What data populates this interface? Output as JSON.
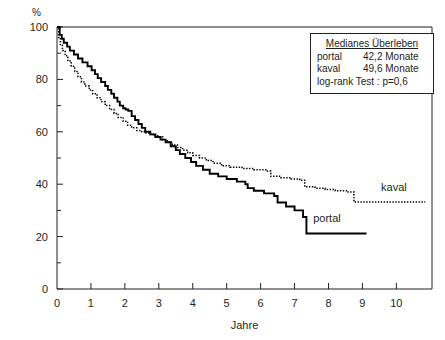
{
  "chart_data": {
    "type": "line",
    "title": "",
    "xlabel": "Jahre",
    "ylabel": "%",
    "xlim": [
      0,
      11.05
    ],
    "ylim": [
      0,
      100
    ],
    "grid": false,
    "legend_position": "top-right",
    "x_ticks": [
      "0",
      "1",
      "2",
      "3",
      "4",
      "5",
      "6",
      "7",
      "8",
      "9",
      "10"
    ],
    "x_tick_values": [
      0,
      1,
      2,
      3,
      4,
      5,
      6,
      7,
      8,
      9,
      10
    ],
    "y_ticks": [
      "0",
      "20",
      "40",
      "60",
      "80",
      "100"
    ],
    "y_tick_values": [
      0,
      20,
      40,
      60,
      80,
      100
    ],
    "y_minor_values": [
      10,
      30,
      50,
      70,
      90
    ],
    "series": [
      {
        "name": "portal",
        "style": "solid",
        "label": "portal",
        "label_x": 7.55,
        "label_y": 25.5,
        "steps": [
          [
            0.0,
            100
          ],
          [
            0.08,
            97
          ],
          [
            0.14,
            95.5
          ],
          [
            0.2,
            94
          ],
          [
            0.3,
            92.5
          ],
          [
            0.38,
            91
          ],
          [
            0.5,
            89.5
          ],
          [
            0.62,
            88
          ],
          [
            0.75,
            86.5
          ],
          [
            0.9,
            85
          ],
          [
            1.02,
            83.5
          ],
          [
            1.12,
            82
          ],
          [
            1.2,
            80.5
          ],
          [
            1.3,
            79
          ],
          [
            1.42,
            77.5
          ],
          [
            1.5,
            76
          ],
          [
            1.6,
            74.5
          ],
          [
            1.68,
            73
          ],
          [
            1.78,
            71.5
          ],
          [
            1.85,
            70
          ],
          [
            1.95,
            69
          ],
          [
            2.02,
            68.5
          ],
          [
            2.1,
            68
          ],
          [
            2.2,
            66
          ],
          [
            2.3,
            64.5
          ],
          [
            2.4,
            63
          ],
          [
            2.5,
            61.5
          ],
          [
            2.6,
            60
          ],
          [
            2.75,
            59
          ],
          [
            2.9,
            58
          ],
          [
            3.05,
            57
          ],
          [
            3.2,
            56
          ],
          [
            3.35,
            54.5
          ],
          [
            3.5,
            53
          ],
          [
            3.62,
            51.5
          ],
          [
            3.78,
            50
          ],
          [
            3.95,
            48.5
          ],
          [
            4.1,
            47
          ],
          [
            4.3,
            45.5
          ],
          [
            4.5,
            44
          ],
          [
            4.75,
            43
          ],
          [
            5.0,
            42
          ],
          [
            5.3,
            41
          ],
          [
            5.55,
            40
          ],
          [
            5.62,
            38.5
          ],
          [
            5.8,
            37.5
          ],
          [
            6.1,
            36.5
          ],
          [
            6.4,
            35.5
          ],
          [
            6.5,
            33
          ],
          [
            6.75,
            31.5
          ],
          [
            7.0,
            30
          ],
          [
            7.25,
            27.5
          ],
          [
            7.35,
            21.2
          ],
          [
            9.12,
            21.2
          ]
        ]
      },
      {
        "name": "kaval",
        "style": "dotted",
        "label": "kaval",
        "label_x": 9.55,
        "label_y": 37.5,
        "steps": [
          [
            0.0,
            100
          ],
          [
            0.05,
            96
          ],
          [
            0.1,
            93
          ],
          [
            0.16,
            91
          ],
          [
            0.24,
            89
          ],
          [
            0.32,
            87
          ],
          [
            0.42,
            85
          ],
          [
            0.52,
            83
          ],
          [
            0.62,
            81
          ],
          [
            0.72,
            79
          ],
          [
            0.82,
            77.5
          ],
          [
            0.95,
            76
          ],
          [
            1.05,
            74.5
          ],
          [
            1.18,
            73
          ],
          [
            1.3,
            71.5
          ],
          [
            1.42,
            70
          ],
          [
            1.55,
            68.5
          ],
          [
            1.68,
            67
          ],
          [
            1.8,
            65.5
          ],
          [
            1.95,
            64
          ],
          [
            2.08,
            62.5
          ],
          [
            2.2,
            61.5
          ],
          [
            2.35,
            60.5
          ],
          [
            2.5,
            60
          ],
          [
            2.62,
            59.5
          ],
          [
            2.75,
            59
          ],
          [
            2.88,
            58.5
          ],
          [
            3.0,
            58
          ],
          [
            3.12,
            57
          ],
          [
            3.25,
            56
          ],
          [
            3.4,
            55
          ],
          [
            3.55,
            54
          ],
          [
            3.7,
            53
          ],
          [
            3.85,
            52
          ],
          [
            4.0,
            51
          ],
          [
            4.2,
            50
          ],
          [
            4.4,
            49
          ],
          [
            4.6,
            48
          ],
          [
            4.85,
            47
          ],
          [
            5.1,
            46.5
          ],
          [
            5.45,
            46
          ],
          [
            5.8,
            45.5
          ],
          [
            6.15,
            45
          ],
          [
            6.3,
            43
          ],
          [
            6.6,
            42.5
          ],
          [
            6.9,
            42
          ],
          [
            7.15,
            41.5
          ],
          [
            7.3,
            39
          ],
          [
            7.6,
            38.5
          ],
          [
            7.9,
            38
          ],
          [
            8.2,
            37.5
          ],
          [
            8.55,
            37
          ],
          [
            8.75,
            33.2
          ],
          [
            10.85,
            33.2
          ]
        ]
      }
    ],
    "annotation_box": {
      "title": "Medianes Überleben",
      "rows": [
        {
          "key": "portal",
          "value": "42,2 Monate"
        },
        {
          "key": "kaval",
          "value": "49,6 Monate"
        }
      ],
      "test": "log-rank Test : p=0,6"
    }
  }
}
